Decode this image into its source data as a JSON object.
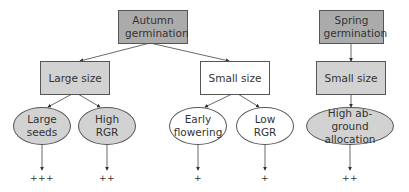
{
  "diagram": {
    "autumn": {
      "root": "Autumn germination",
      "large_size": "Large size",
      "small_size": "Small size",
      "traits": [
        {
          "label": "Large seeds",
          "score": "+++"
        },
        {
          "label": "High RGR",
          "score": "++"
        },
        {
          "label": "Early flowering",
          "score": "+"
        },
        {
          "label": "Low RGR",
          "score": "+"
        }
      ]
    },
    "spring": {
      "root": "Spring germination",
      "small_size": "Small size",
      "traits": [
        {
          "label": "High ab-ground allocation",
          "score": "++"
        }
      ]
    },
    "colors": {
      "root_fill": "#ababab",
      "size_fill": "#d2d2d2",
      "white_fill": "#ffffff",
      "stroke": "#555555"
    }
  }
}
